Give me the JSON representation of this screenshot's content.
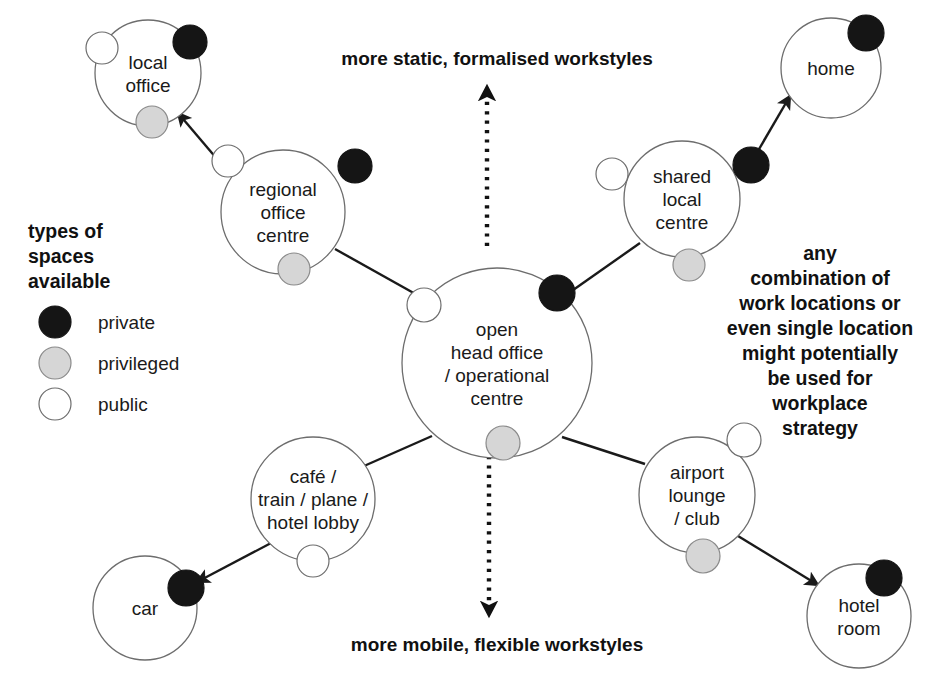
{
  "diagram": {
    "title_top": "more static, formalised workstyles",
    "title_bottom": "more mobile, flexible workstyles",
    "side_note_lines": [
      "any",
      "combination of",
      "work locations or",
      "even single location",
      "might potentially",
      "be used for",
      "workplace",
      "strategy"
    ],
    "legend": {
      "title_lines": [
        "types of",
        "spaces",
        "available"
      ],
      "items": [
        {
          "key": "private",
          "label": "private",
          "color": "#151515"
        },
        {
          "key": "privileged",
          "label": "privileged",
          "color": "#d6d6d6"
        },
        {
          "key": "public",
          "label": "public",
          "color": "#ffffff"
        }
      ]
    },
    "nodes": [
      {
        "id": "local-office",
        "lines": [
          "local",
          "office"
        ],
        "cx": 148,
        "cy": 73,
        "r": 53,
        "dots": [
          {
            "type": "public",
            "cx": 102,
            "cy": 48,
            "r": 16
          },
          {
            "type": "private",
            "cx": 190,
            "cy": 42,
            "r": 17
          },
          {
            "type": "privileged",
            "cx": 152,
            "cy": 122,
            "r": 16
          }
        ]
      },
      {
        "id": "regional-office-centre",
        "lines": [
          "regional",
          "office",
          "centre"
        ],
        "cx": 283,
        "cy": 212,
        "r": 62,
        "dots": [
          {
            "type": "public",
            "cx": 228,
            "cy": 161,
            "r": 16
          },
          {
            "type": "private",
            "cx": 355,
            "cy": 166,
            "r": 17
          },
          {
            "type": "privileged",
            "cx": 294,
            "cy": 269,
            "r": 16
          }
        ]
      },
      {
        "id": "open-head-office",
        "lines": [
          "open",
          "head office",
          "/ operational",
          "centre"
        ],
        "cx": 497,
        "cy": 363,
        "r": 95,
        "dots": [
          {
            "type": "public",
            "cx": 424,
            "cy": 305,
            "r": 17
          },
          {
            "type": "private",
            "cx": 557,
            "cy": 293,
            "r": 18
          },
          {
            "type": "privileged",
            "cx": 503,
            "cy": 443,
            "r": 17
          }
        ]
      },
      {
        "id": "shared-local-centre",
        "lines": [
          "shared",
          "local",
          "centre"
        ],
        "cx": 682,
        "cy": 199,
        "r": 58,
        "dots": [
          {
            "type": "public",
            "cx": 612,
            "cy": 174,
            "r": 16
          },
          {
            "type": "private",
            "cx": 751,
            "cy": 165,
            "r": 18
          },
          {
            "type": "privileged",
            "cx": 689,
            "cy": 265,
            "r": 16
          }
        ]
      },
      {
        "id": "home",
        "lines": [
          "home"
        ],
        "cx": 831,
        "cy": 68,
        "r": 50,
        "dots": [
          {
            "type": "private",
            "cx": 866,
            "cy": 33,
            "r": 18
          }
        ]
      },
      {
        "id": "cafe-train-plane-hotel-lobby",
        "lines": [
          "café /",
          "train / plane /",
          "hotel lobby"
        ],
        "cx": 313,
        "cy": 499,
        "r": 62,
        "dots": [
          {
            "type": "public",
            "cx": 313,
            "cy": 561,
            "r": 16
          }
        ]
      },
      {
        "id": "car",
        "lines": [
          "car"
        ],
        "cx": 145,
        "cy": 608,
        "r": 52,
        "dots": [
          {
            "type": "private",
            "cx": 186,
            "cy": 588,
            "r": 18
          }
        ]
      },
      {
        "id": "airport-lounge-club",
        "lines": [
          "airport",
          "lounge",
          "/ club"
        ],
        "cx": 697,
        "cy": 495,
        "r": 58,
        "dots": [
          {
            "type": "public",
            "cx": 744,
            "cy": 440,
            "r": 17
          },
          {
            "type": "privileged",
            "cx": 703,
            "cy": 556,
            "r": 17
          }
        ]
      },
      {
        "id": "hotel-room",
        "lines": [
          "hotel",
          "room"
        ],
        "cx": 859,
        "cy": 616,
        "r": 52,
        "dots": [
          {
            "type": "private",
            "cx": 884,
            "cy": 578,
            "r": 18
          }
        ]
      }
    ],
    "connectors": [
      {
        "id": "regional-to-centre",
        "x1": 335,
        "y1": 249,
        "x2": 419,
        "y2": 296,
        "arrow": false
      },
      {
        "id": "regional-to-local",
        "x1": 234,
        "y1": 179,
        "x2": 178,
        "y2": 113,
        "arrow": true
      },
      {
        "id": "shared-to-centre",
        "x1": 640,
        "y1": 243,
        "x2": 566,
        "y2": 295,
        "arrow": false
      },
      {
        "id": "shared-to-home",
        "x1": 748,
        "y1": 168,
        "x2": 790,
        "y2": 96,
        "arrow": true
      },
      {
        "id": "centre-to-cafe",
        "x1": 432,
        "y1": 436,
        "x2": 364,
        "y2": 466,
        "arrow": false
      },
      {
        "id": "cafe-to-car",
        "x1": 273,
        "y1": 542,
        "x2": 197,
        "y2": 582,
        "arrow": true
      },
      {
        "id": "centre-to-airport",
        "x1": 562,
        "y1": 437,
        "x2": 645,
        "y2": 464,
        "arrow": false
      },
      {
        "id": "airport-to-hotel",
        "x1": 738,
        "y1": 536,
        "x2": 818,
        "y2": 585,
        "arrow": true
      }
    ],
    "axis_arrows": [
      {
        "id": "static-axis-arrow",
        "x": 487,
        "y1": 246,
        "y2": 90,
        "direction": "up"
      },
      {
        "id": "mobile-axis-arrow",
        "x": 489,
        "y1": 456,
        "y2": 612,
        "direction": "down"
      }
    ]
  }
}
